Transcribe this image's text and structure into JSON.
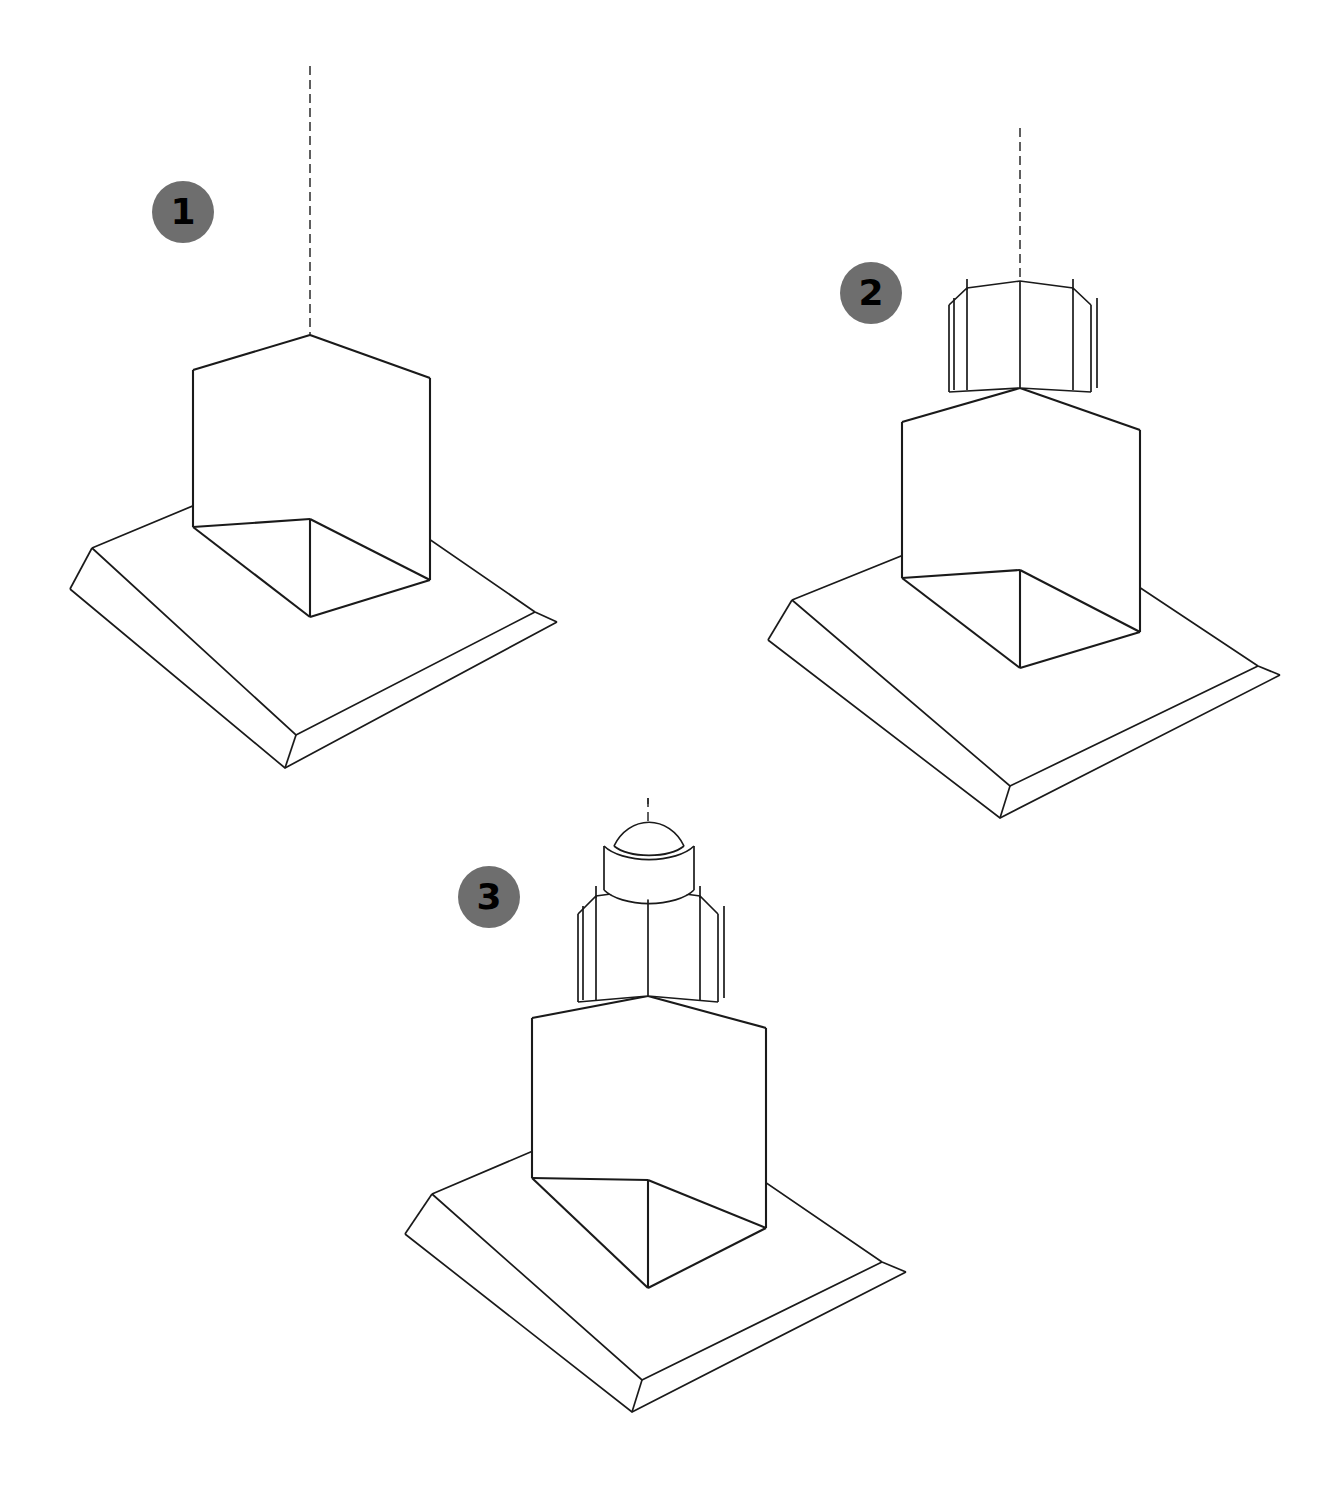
{
  "page": {
    "background_color": "#ffffff",
    "line_color": "#1a1a1a",
    "badge_color": "#6e6e6e",
    "badge_text_color": "#000000",
    "width": 1335,
    "height": 1495
  },
  "steps": [
    {
      "number": "1",
      "badge_label": "1",
      "name": "base-and-main-block",
      "caption": "",
      "badge_position": {
        "x": 152,
        "y": 181
      },
      "parts": [
        "vertical-center-axis",
        "square-base-slab",
        "base-plinth",
        "main-cube-block"
      ]
    },
    {
      "number": "2",
      "badge_label": "2",
      "name": "octagonal-tower-section",
      "caption": "",
      "badge_position": {
        "x": 840,
        "y": 262
      },
      "parts": [
        "vertical-center-axis",
        "square-base-slab",
        "base-plinth",
        "main-cube-block",
        "octagonal-drum"
      ]
    },
    {
      "number": "3",
      "badge_label": "3",
      "name": "cupola-and-dome",
      "caption": "",
      "badge_position": {
        "x": 458,
        "y": 866
      },
      "parts": [
        "vertical-center-axis",
        "square-base-slab",
        "base-plinth",
        "main-cube-block",
        "octagonal-drum",
        "cylindrical-lantern",
        "dome-cap"
      ]
    }
  ]
}
